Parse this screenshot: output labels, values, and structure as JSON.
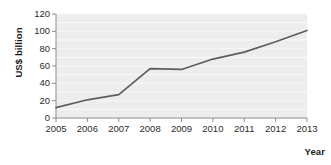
{
  "chart_data": {
    "type": "line",
    "title": "",
    "xlabel": "Year",
    "ylabel": "US$ billion",
    "categories": [
      "2005",
      "2006",
      "2007",
      "2008",
      "2009",
      "2010",
      "2011",
      "2012",
      "2013"
    ],
    "x": [
      2005,
      2006,
      2007,
      2008,
      2009,
      2010,
      2011,
      2012,
      2013
    ],
    "values": [
      12,
      21,
      27,
      57,
      56,
      68,
      76,
      88,
      101
    ],
    "series": [
      {
        "name": "US$ billion",
        "values": [
          12,
          21,
          27,
          57,
          56,
          68,
          76,
          88,
          101
        ]
      }
    ],
    "yticks": [
      0,
      20,
      40,
      60,
      80,
      100,
      120
    ],
    "ytick_labels": [
      "0",
      "20",
      "40",
      "60",
      "80",
      "100",
      "120"
    ],
    "xtick_labels": [
      "2005",
      "2006",
      "2007",
      "2008",
      "2009",
      "2010",
      "2011",
      "2012",
      "2013"
    ],
    "ylim": [
      0,
      120
    ],
    "xlim": [
      2005,
      2013
    ],
    "grid": "horizontal",
    "legend": "none",
    "markers": "none",
    "line_color": "#5e5e5e",
    "plot_background": "#ededed",
    "gridline_color": "#f7f7f7",
    "axis_color": "#8c8c8c",
    "text_color": "#2b2b2b",
    "page_background": "#ffffff"
  }
}
